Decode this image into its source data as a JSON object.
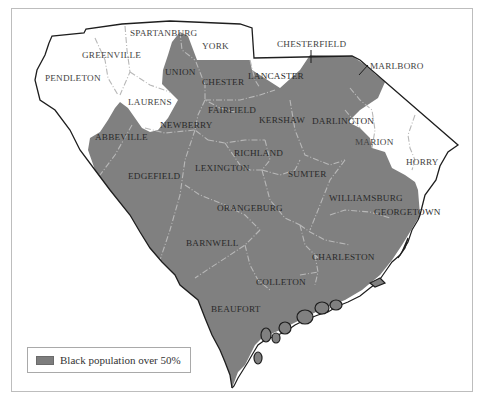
{
  "map": {
    "title": "South Carolina counties",
    "colors": {
      "majority_black": "#808080",
      "other": "#ffffff",
      "border": "#1e1e1e",
      "county_line": "#b8b8b8"
    },
    "counties": {
      "spartanburg": "SPARTANBURG",
      "york": "YORK",
      "chesterfield": "CHESTERFIELD",
      "marlboro": "MARLBORO",
      "greenville": "GREENVILLE",
      "union": "UNION",
      "chester": "CHESTER",
      "lancaster": "LANCASTER",
      "pendleton": "PENDLETON",
      "laurens": "LAURENS",
      "fairfield": "FAIRFIELD",
      "kershaw": "KERSHAW",
      "darlington": "DARLINGTON",
      "abbeville": "ABBEVILLE",
      "newberry": "NEWBERRY",
      "marion": "MARION",
      "richland": "RICHLAND",
      "horry": "HORRY",
      "edgefield": "EDGEFIELD",
      "lexington": "LEXINGTON",
      "sumter": "SUMTER",
      "williamsburg": "WILLIAMSBURG",
      "orangeburg": "ORANGEBURG",
      "georgetown": "GEORGETOWN",
      "barnwell": "BARNWELL",
      "charleston": "CHARLESTON",
      "colleton": "COLLETON",
      "beaufort": "BEAUFORT"
    },
    "shaded_counties": [
      "UNION",
      "CHESTER",
      "FAIRFIELD",
      "KERSHAW",
      "DARLINGTON",
      "MARLBORO",
      "ABBEVILLE",
      "NEWBERRY",
      "RICHLAND",
      "EDGEFIELD",
      "LEXINGTON",
      "SUMTER",
      "WILLIAMSBURG",
      "ORANGEBURG",
      "GEORGETOWN",
      "BARNWELL",
      "CHARLESTON",
      "COLLETON",
      "BEAUFORT"
    ],
    "unshaded_counties": [
      "SPARTANBURG",
      "YORK",
      "CHESTERFIELD",
      "GREENVILLE",
      "PENDLETON",
      "LAURENS",
      "MARION",
      "HORRY",
      "LANCASTER"
    ]
  },
  "legend": {
    "label": "Black population over 50%",
    "swatch_color": "#7d7d7d"
  }
}
